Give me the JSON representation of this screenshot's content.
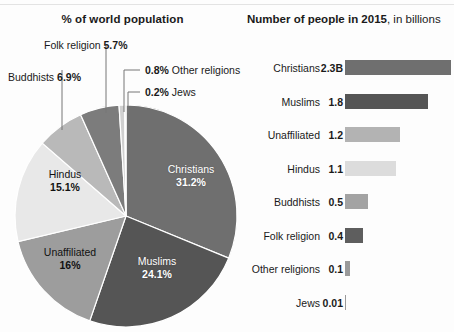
{
  "pie": {
    "title": "% of world population",
    "inner_labels": [
      {
        "name": "Christians",
        "value": "31.2%",
        "text_style": "light"
      },
      {
        "name": "Muslims",
        "value": "24.1%",
        "text_style": "light"
      },
      {
        "name": "Unaffiliated",
        "value": "16%",
        "text_style": "dark"
      },
      {
        "name": "Hindus",
        "value": "15.1%",
        "text_style": "dark"
      }
    ],
    "callouts": [
      {
        "name": "Buddhists",
        "value": "6.9%",
        "order": "name-first"
      },
      {
        "name": "Folk religion",
        "value": "5.7%",
        "order": "name-first"
      },
      {
        "name": "Other religions",
        "value": "0.8%",
        "order": "value-first"
      },
      {
        "name": "Jews",
        "value": "0.2%",
        "order": "value-first"
      }
    ]
  },
  "bars": {
    "title_strong": "Number of people in 2015",
    "title_rest": ", in billions",
    "rows": [
      {
        "label": "Christians",
        "value_text": "2.3B",
        "value": 2.3,
        "color": "#6f6f6f"
      },
      {
        "label": "Muslims",
        "value_text": "1.8",
        "value": 1.8,
        "color": "#555555"
      },
      {
        "label": "Unaffiliated",
        "value_text": "1.2",
        "value": 1.2,
        "color": "#b3b3b3"
      },
      {
        "label": "Hindus",
        "value_text": "1.1",
        "value": 1.1,
        "color": "#dcdcdc"
      },
      {
        "label": "Buddhists",
        "value_text": "0.5",
        "value": 0.5,
        "color": "#a3a3a3"
      },
      {
        "label": "Folk religion",
        "value_text": "0.4",
        "value": 0.4,
        "color": "#5e5e5e"
      },
      {
        "label": "Other religions",
        "value_text": "0.1",
        "value": 0.1,
        "color": "#9a9a9a"
      },
      {
        "label": "Jews",
        "value_text": "0.01",
        "value": 0.01,
        "color": "#9a9a9a"
      }
    ],
    "px_per_billion": 46
  },
  "chart_data": [
    {
      "type": "pie",
      "title": "% of world population",
      "labels": [
        "Christians",
        "Muslims",
        "Unaffiliated",
        "Hindus",
        "Buddhists",
        "Folk religion",
        "Other religions",
        "Jews"
      ],
      "values": [
        31.2,
        24.1,
        16,
        15.1,
        6.9,
        5.7,
        0.8,
        0.2
      ],
      "value_labels": [
        "31.2%",
        "24.1%",
        "16%",
        "15.1%",
        "6.9%",
        "5.7%",
        "0.8%",
        "0.2%"
      ],
      "unit": "percent of world population",
      "colors": [
        "#6f6f6f",
        "#555555",
        "#9d9d9d",
        "#e8e8e8",
        "#b9b9b9",
        "#7c7c7c",
        "#d0d0d0",
        "#a8a8a8"
      ],
      "start_angle_deg": 0,
      "direction": "clockwise",
      "legend": "none",
      "grid": false
    },
    {
      "type": "bar",
      "orientation": "horizontal",
      "title": "Number of people in 2015, in billions",
      "categories": [
        "Christians",
        "Muslims",
        "Unaffiliated",
        "Hindus",
        "Buddhists",
        "Folk religion",
        "Other religions",
        "Jews"
      ],
      "values": [
        2.3,
        1.8,
        1.2,
        1.1,
        0.5,
        0.4,
        0.1,
        0.01
      ],
      "data_labels": [
        "2.3B",
        "1.8",
        "1.2",
        "1.1",
        "0.5",
        "0.4",
        "0.1",
        "0.01"
      ],
      "xlabel": "billions of people",
      "ylabel": "",
      "xlim": [
        0,
        2.3
      ],
      "legend": "none",
      "grid": false,
      "axis_visible": false
    }
  ]
}
